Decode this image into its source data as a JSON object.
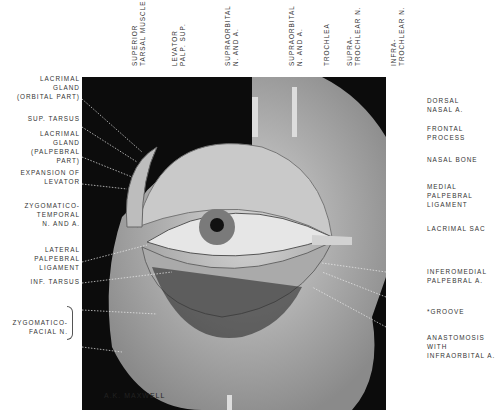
{
  "figure": {
    "signature": "A.K. MAXWELL"
  },
  "labels_left": [
    {
      "text": "LACRIMAL\nGLAND\n(ORBITAL PART)"
    },
    {
      "text": "SUP. TARSUS"
    },
    {
      "text": "LACRIMAL\nGLAND\n(PALPEBRAL\nPART)"
    },
    {
      "text": "EXPANSION OF\nLEVATOR"
    },
    {
      "text": "ZYGOMATICO-\nTEMPORAL\nN. AND A."
    },
    {
      "text": "LATERAL\nPALPEBRAL\nLIGAMENT"
    },
    {
      "text": "INF. TARSUS"
    },
    {
      "text": "ZYGOMATICO-\nFACIAL N."
    }
  ],
  "labels_top": [
    {
      "text": "SUPERIOR\nTARSAL MUSCLE"
    },
    {
      "text": "LEVATOR\nPALP. SUP."
    },
    {
      "text": "SUPRAORBITAL\nN. AND A."
    },
    {
      "text": "SUPRAORBITAL\nN. AND A."
    },
    {
      "text": "TROCHLEA"
    },
    {
      "text": "SUPRA-\nTROCHLEAR N."
    },
    {
      "text": "INFRA-\nTROCHLEAR N."
    }
  ],
  "labels_right": [
    {
      "text": "DORSAL\nNASAL A."
    },
    {
      "text": "FRONTAL\nPROCESS"
    },
    {
      "text": "NASAL BONE"
    },
    {
      "text": "MEDIAL\nPALPEBRAL\nLIGAMENT"
    },
    {
      "text": "LACRIMAL SAC"
    },
    {
      "text": "INFEROMEDIAL\nPALPEBRAL A."
    },
    {
      "text": "*GROOVE"
    },
    {
      "text": "ANASTOMOSIS\nWITH\nINFRAORBITAL A."
    }
  ],
  "colors": {
    "background": "#ffffff",
    "plate": "#0c0c0c",
    "tissue": "#b5b5b5",
    "text": "#333333"
  }
}
